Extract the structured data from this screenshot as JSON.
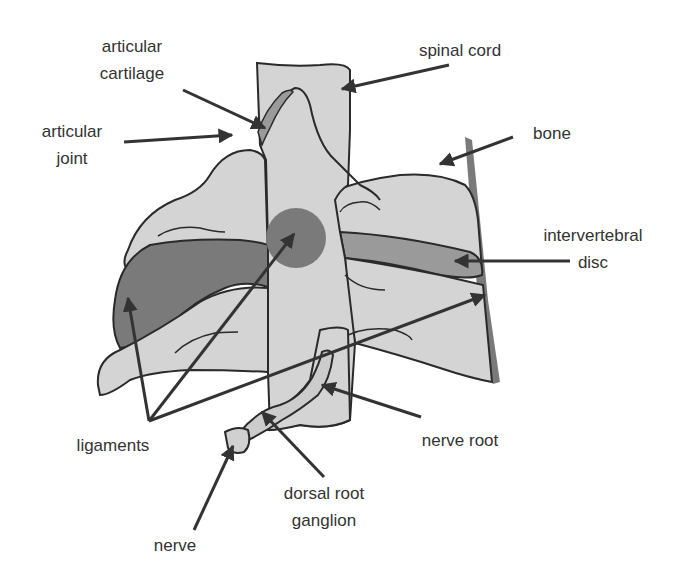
{
  "figure": {
    "colors": {
      "background": "#ffffff",
      "bone_fill": "#d4d4d4",
      "ligament_fill": "#7a7a7a",
      "disc_fill": "#9a9a9a",
      "outline": "#2a2a2a",
      "arrow": "#333333",
      "text": "#333333"
    }
  },
  "labels": {
    "articular_cartilage": {
      "line1": "articular",
      "line2": "cartilage"
    },
    "articular_joint": {
      "line1": "articular",
      "line2": "joint"
    },
    "spinal_cord": {
      "line1": "spinal cord"
    },
    "bone": {
      "line1": "bone"
    },
    "intervertebral_disc": {
      "line1": "intervertebral",
      "line2": "disc"
    },
    "ligaments": {
      "line1": "ligaments"
    },
    "nerve_root": {
      "line1": "nerve root"
    },
    "dorsal_root_ganglion": {
      "line1": "dorsal root",
      "line2": "ganglion"
    },
    "nerve": {
      "line1": "nerve"
    }
  }
}
